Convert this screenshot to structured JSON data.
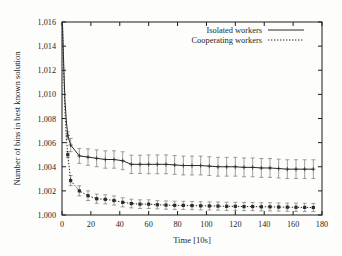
{
  "chart_data": {
    "type": "line",
    "title": "",
    "xlabel": "Time [10s]",
    "ylabel": "Number of bins in best known solution",
    "xlim": [
      0,
      180
    ],
    "ylim": [
      1000,
      1016
    ],
    "xticks": [
      0,
      20,
      40,
      60,
      80,
      100,
      120,
      140,
      160,
      180
    ],
    "yticks": [
      1000,
      1002,
      1004,
      1006,
      1008,
      1010,
      1012,
      1014,
      1016
    ],
    "xtick_labels": [
      "0",
      "20",
      "40",
      "60",
      "80",
      "100",
      "120",
      "140",
      "160",
      "180"
    ],
    "ytick_labels": [
      "1,000",
      "1,002",
      "1,004",
      "1,006",
      "1,008",
      "1,010",
      "1,012",
      "1,014",
      "1,016"
    ],
    "grid": false,
    "legend_position": "top-right",
    "errorbars": true,
    "series": [
      {
        "name": "Isolated workers",
        "style": "solid",
        "marker": "plus",
        "color": "#2b2b2b",
        "x": [
          0.3,
          1,
          2,
          3,
          4,
          6,
          12,
          18,
          24,
          30,
          36,
          42,
          48,
          54,
          60,
          66,
          72,
          78,
          84,
          90,
          96,
          102,
          108,
          114,
          120,
          126,
          132,
          138,
          144,
          150,
          156,
          162,
          168,
          174
        ],
        "y": [
          1016.0,
          1013.2,
          1009.6,
          1007.8,
          1006.6,
          1005.8,
          1004.9,
          1004.8,
          1004.7,
          1004.6,
          1004.6,
          1004.5,
          1004.2,
          1004.2,
          1004.2,
          1004.2,
          1004.2,
          1004.15,
          1004.1,
          1004.1,
          1004.1,
          1004.05,
          1004.0,
          1004.0,
          1004.0,
          1003.95,
          1003.95,
          1003.9,
          1003.9,
          1003.85,
          1003.8,
          1003.8,
          1003.8,
          1003.8
        ],
        "yerr": [
          0.0,
          0.0,
          0.0,
          0.0,
          0.3,
          0.55,
          0.62,
          0.68,
          0.7,
          0.72,
          0.72,
          0.74,
          0.76,
          0.76,
          0.78,
          0.78,
          0.78,
          0.78,
          0.78,
          0.78,
          0.78,
          0.78,
          0.78,
          0.78,
          0.78,
          0.78,
          0.78,
          0.78,
          0.78,
          0.78,
          0.78,
          0.78,
          0.78,
          0.78
        ]
      },
      {
        "name": "Cooperating workers",
        "style": "dotted",
        "marker": "square",
        "color": "#2b2b2b",
        "x": [
          0.3,
          1,
          2,
          3,
          4,
          6,
          12,
          18,
          24,
          30,
          36,
          42,
          48,
          54,
          60,
          66,
          72,
          78,
          84,
          90,
          96,
          102,
          108,
          114,
          120,
          126,
          132,
          138,
          144,
          150,
          156,
          162,
          168,
          174
        ],
        "y": [
          1016.0,
          1012.6,
          1008.8,
          1006.4,
          1005.0,
          1002.85,
          1002.0,
          1001.6,
          1001.35,
          1001.3,
          1001.2,
          1001.05,
          1000.95,
          1000.9,
          1000.9,
          1000.85,
          1000.82,
          1000.8,
          1000.8,
          1000.78,
          1000.76,
          1000.75,
          1000.74,
          1000.72,
          1000.72,
          1000.7,
          1000.7,
          1000.68,
          1000.68,
          1000.66,
          1000.65,
          1000.64,
          1000.63,
          1000.62
        ],
        "yerr": [
          0.0,
          0.0,
          0.0,
          0.0,
          0.25,
          0.42,
          0.42,
          0.4,
          0.38,
          0.38,
          0.38,
          0.38,
          0.36,
          0.36,
          0.36,
          0.34,
          0.34,
          0.34,
          0.34,
          0.34,
          0.34,
          0.34,
          0.34,
          0.34,
          0.34,
          0.34,
          0.34,
          0.34,
          0.34,
          0.34,
          0.34,
          0.34,
          0.34,
          0.34
        ]
      }
    ]
  }
}
